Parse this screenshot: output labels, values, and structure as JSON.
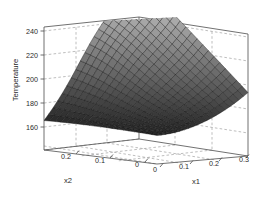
{
  "figure": {
    "background_color": "#ffffff",
    "axis_line_color": "#555555",
    "grid_color": "#999999",
    "grid_style": "dashed",
    "text_color": "#2b2b2b"
  },
  "chart_data": {
    "type": "surface",
    "title": "",
    "subtitle": "",
    "xlabel": "x1",
    "ylabel": "x2",
    "zlabel": "Temperature",
    "grid": true,
    "legend": "none",
    "colormap": "gray",
    "projection": "3d",
    "view": {
      "azimuth": -37.5,
      "elevation": 30
    },
    "xlim": [
      0,
      0.3
    ],
    "ylim": [
      0,
      0.25
    ],
    "zlim": [
      150,
      245
    ],
    "xticks": [
      0,
      0.1,
      0.2,
      0.3
    ],
    "xtick_labels": [
      "0",
      "0.1",
      "0.2",
      "0.3"
    ],
    "yticks": [
      0,
      0.1,
      0.2
    ],
    "ytick_labels": [
      "0",
      "0.1",
      "0.2"
    ],
    "zticks": [
      160,
      180,
      200,
      220,
      240
    ],
    "ztick_labels": [
      "160",
      "180",
      "200",
      "220",
      "240"
    ],
    "mesh_nx": 21,
    "mesh_ny": 21,
    "surface_notes": "Saddle-like response surface: flat ridge near x1=0 at about 172, shallow valley near x1=0.12 dipping to about 158, steep rise to about 200 at x1=0.3",
    "x": [
      0,
      0.015,
      0.03,
      0.045,
      0.06,
      0.075,
      0.09,
      0.105,
      0.12,
      0.135,
      0.15,
      0.165,
      0.18,
      0.195,
      0.21,
      0.225,
      0.24,
      0.255,
      0.27,
      0.285,
      0.3
    ],
    "y": [
      0,
      0.0125,
      0.025,
      0.0375,
      0.05,
      0.0625,
      0.075,
      0.0875,
      0.1,
      0.1125,
      0.125,
      0.1375,
      0.15,
      0.1625,
      0.175,
      0.1875,
      0.2,
      0.2125,
      0.225,
      0.2375,
      0.25
    ],
    "z_min": 157,
    "z_max": 201,
    "z_corner_values": {
      "x1_0_x2_0": 171,
      "x1_0_x2_max": 172,
      "x1_max_x2_0": 200,
      "x1_max_x2_max": 196
    },
    "z_sample_grid": [
      [
        172,
        170,
        167,
        164,
        162,
        160,
        159,
        158,
        158,
        159,
        161,
        164,
        168,
        172,
        177,
        183,
        189,
        196
      ],
      [
        172,
        170,
        167,
        165,
        163,
        161,
        160,
        159,
        159,
        161,
        163,
        166,
        170,
        174,
        179,
        185,
        191,
        197
      ],
      [
        172,
        171,
        168,
        166,
        164,
        163,
        162,
        161,
        162,
        163,
        166,
        169,
        172,
        177,
        182,
        187,
        193,
        198
      ],
      [
        173,
        171,
        169,
        167,
        166,
        165,
        164,
        164,
        165,
        167,
        169,
        172,
        176,
        180,
        185,
        190,
        195,
        199
      ],
      [
        173,
        172,
        170,
        169,
        168,
        167,
        167,
        167,
        169,
        171,
        173,
        176,
        180,
        184,
        188,
        192,
        197,
        200
      ],
      [
        173,
        172,
        171,
        170,
        170,
        170,
        170,
        171,
        173,
        175,
        178,
        181,
        184,
        188,
        191,
        195,
        198,
        201
      ],
      [
        173,
        173,
        172,
        172,
        172,
        173,
        174,
        175,
        177,
        180,
        183,
        186,
        189,
        192,
        194,
        197,
        199,
        201
      ],
      [
        173,
        173,
        173,
        174,
        175,
        176,
        178,
        180,
        183,
        186,
        189,
        191,
        193,
        195,
        197,
        198,
        200,
        201
      ],
      [
        173,
        174,
        175,
        176,
        178,
        180,
        183,
        186,
        189,
        191,
        193,
        195,
        196,
        197,
        198,
        199,
        200,
        200
      ],
      [
        173,
        174,
        176,
        178,
        181,
        184,
        187,
        190,
        193,
        195,
        196,
        197,
        198,
        198,
        199,
        199,
        199,
        199
      ]
    ]
  },
  "axes": {
    "z_axis": {
      "name": "Temperature",
      "label": "Temperature",
      "ticks": [
        "240",
        "220",
        "200",
        "180",
        "160"
      ]
    },
    "x_axis": {
      "name": "x1",
      "label": "x1",
      "ticks": [
        "0",
        "0.1",
        "0.2",
        "0.3"
      ]
    },
    "y_axis": {
      "name": "x2",
      "label": "x2",
      "ticks": [
        "0.2",
        "0.1",
        "0"
      ]
    }
  }
}
